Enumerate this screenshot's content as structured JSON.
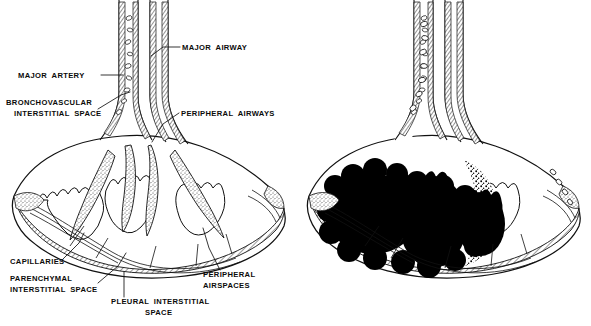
{
  "figure": {
    "background_color": "#ffffff",
    "ink_color": "#111111",
    "fill_color": "#000000",
    "panels": [
      {
        "id": "normal",
        "name": "normal-lung-panel",
        "description": "Normal secondary pulmonary lobule with air-filled peripheral airspaces, labeled"
      },
      {
        "id": "consolidated",
        "name": "consolidated-lung-panel",
        "description": "Same lobule with airspaces filled (black) and widened bronchovascular cuff, unlabeled"
      }
    ],
    "labels": [
      {
        "id": "major-airway",
        "text": "MAJOR AIRWAY",
        "x": 182,
        "y": 50,
        "anchor": "start",
        "leader": "M 180,47 L 163,47 L 151,56"
      },
      {
        "id": "major-artery",
        "text": "MAJOR ARTERY",
        "x": 18,
        "y": 78,
        "anchor": "start",
        "leader": "M 101,75 L 123,75"
      },
      {
        "id": "bronchovascular-interstitial-space",
        "text": "BRONCHOVASCULAR",
        "text2": "INTERSTITIAL SPACE",
        "x": 6,
        "y": 105,
        "x2": 14,
        "y2": 115,
        "anchor": "start",
        "leader": "M 98,109 L 121,95 L 130,92"
      },
      {
        "id": "peripheral-airways",
        "text": "PERIPHERAL AIRWAYS",
        "x": 181,
        "y": 116,
        "anchor": "start",
        "leader": "M 179,113 L 163,124 L 152,142"
      },
      {
        "id": "capillaries",
        "text": "CAPILLARIES",
        "x": 10,
        "y": 264,
        "anchor": "start",
        "leader": "M 63,259 L 79,243 L 84,233"
      },
      {
        "id": "parenchymal-interstitial-space",
        "text": "PARENCHYMAL",
        "text2": "INTERSTITIAL SPACE",
        "x": 10,
        "y": 281,
        "x2": 10,
        "y2": 292,
        "anchor": "start",
        "leader": "M 98,283 L 118,266 L 126,253"
      },
      {
        "id": "pleural-interstitial-space",
        "text": "PLEURAL INTERSTITIAL",
        "text2": "SPACE",
        "x": 111,
        "y": 304,
        "x2": 145,
        "y2": 314,
        "anchor": "start",
        "leader": "M 124,297 L 124,272"
      },
      {
        "id": "peripheral-airspaces",
        "text": "PERIPHERAL",
        "text2": "AIRSPACES",
        "x": 203,
        "y": 277,
        "x2": 203,
        "y2": 288,
        "anchor": "start",
        "leader": "M 220,270 L 209,248 L 203,228"
      }
    ]
  }
}
